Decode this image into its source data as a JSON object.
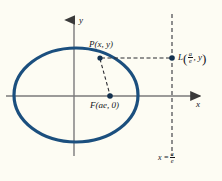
{
  "figure": {
    "name": "ellipse-focus-directrix-diagram",
    "background_color": "#fdfcf3",
    "curve_color": "#1b4f7e",
    "axis_color": "#6b6b6b",
    "ink_color": "#15151a"
  },
  "axes": {
    "x_label": "x",
    "y_label": "y",
    "x_axis_y": 96,
    "y_axis_x": 74
  },
  "ellipse": {
    "center_x": 76,
    "center_y": 95,
    "rx": 62,
    "ry": 47,
    "stroke_width": 3
  },
  "points": [
    {
      "id": "P",
      "letter": "P",
      "coords_text": "(x, y)",
      "x": 100,
      "y": 58,
      "label_x": 89,
      "label_y": 44
    },
    {
      "id": "F",
      "letter": "F",
      "coords_text": "(ae, 0)",
      "x": 110,
      "y": 96,
      "label_x": 92,
      "label_y": 104
    },
    {
      "id": "L",
      "letter": "L",
      "coords_numerator": "a",
      "coords_denominator": "e",
      "coords_second": ", y",
      "x": 172,
      "y": 58,
      "label_x": 178,
      "label_y": 52
    }
  ],
  "directrix": {
    "line_x": 172,
    "top_y": 14,
    "bottom_y": 156,
    "label_lhs": "x =",
    "label_numerator": "a",
    "label_denominator": "e",
    "label_x": 158,
    "label_y": 156
  },
  "connectors": [
    {
      "name": "focal-radius-P-to-F",
      "from": "P",
      "to": "F",
      "style": "dashed"
    },
    {
      "name": "directrix-distance-P-to-L",
      "from": "P",
      "to": "L",
      "style": "dashed"
    }
  ]
}
